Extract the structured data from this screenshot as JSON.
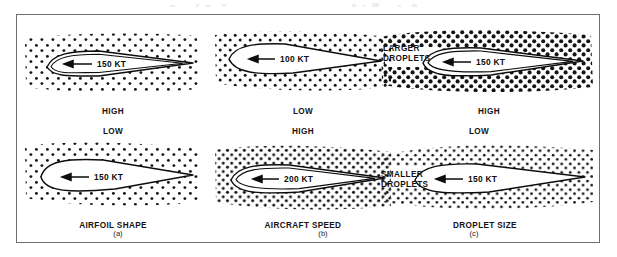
{
  "figure": {
    "frame_color": "#6e6e6e",
    "background": "#ffffff",
    "ink_color": "#141414"
  },
  "columns": [
    {
      "id": "a",
      "caption": "AIRFOIL SHAPE",
      "subfig_label": "(a)",
      "panels": [
        {
          "position": "top",
          "speed_label": "150 KT",
          "catch_rate": "HIGH",
          "catch_rate_position": "below",
          "airfoil": "thin",
          "droplet_size": "small",
          "droplet_density": "medium",
          "side_label": ""
        },
        {
          "position": "bottom",
          "speed_label": "150 KT",
          "catch_rate": "LOW",
          "catch_rate_position": "above",
          "airfoil": "thick",
          "droplet_size": "small",
          "droplet_density": "medium",
          "side_label": ""
        }
      ]
    },
    {
      "id": "b",
      "caption": "AIRCRAFT SPEED",
      "subfig_label": "(b)",
      "panels": [
        {
          "position": "top",
          "speed_label": "100 KT",
          "catch_rate": "LOW",
          "catch_rate_position": "below",
          "airfoil": "thin",
          "droplet_size": "small",
          "droplet_density": "medium",
          "side_label": ""
        },
        {
          "position": "bottom",
          "speed_label": "200 KT",
          "catch_rate": "HIGH",
          "catch_rate_position": "above",
          "airfoil": "thin",
          "droplet_size": "small",
          "droplet_density": "high",
          "side_label": ""
        }
      ]
    },
    {
      "id": "c",
      "caption": "DROPLET SIZE",
      "subfig_label": "(c)",
      "panels": [
        {
          "position": "top",
          "speed_label": "150 KT",
          "catch_rate": "HIGH",
          "catch_rate_position": "below",
          "airfoil": "thin",
          "droplet_size": "large",
          "droplet_density": "high",
          "side_label": "LARGER\nDROPLETS",
          "side_label_line1": "LARGER",
          "side_label_line2": "DROPLETS"
        },
        {
          "position": "bottom",
          "speed_label": "150 KT",
          "catch_rate": "LOW",
          "catch_rate_position": "above",
          "airfoil": "thin",
          "droplet_size": "small",
          "droplet_density": "high",
          "side_label": "SMALLER\nDROPLETS",
          "side_label_line1": "SMALLER",
          "side_label_line2": "DROPLETS"
        }
      ]
    }
  ]
}
